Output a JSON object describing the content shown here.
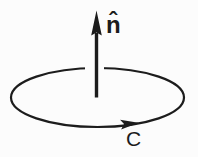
{
  "figure": {
    "type": "vector-diagram",
    "background": "#fcfcfc",
    "ink": "#1c1c1c",
    "labels": {
      "normal": "n̂",
      "curve": "C"
    }
  }
}
